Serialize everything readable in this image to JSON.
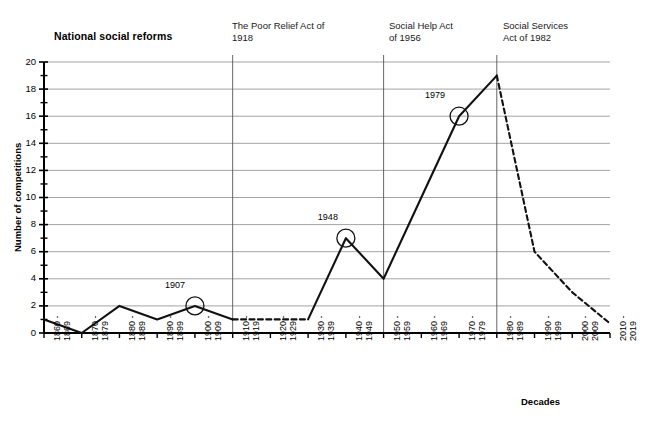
{
  "chart_data": {
    "type": "line",
    "title": "",
    "xlabel": "Decades",
    "ylabel": "Number of competitions",
    "ylim": [
      0,
      20
    ],
    "ytick_step": 2,
    "minor_ticks": true,
    "grid": true,
    "legend": "none",
    "categories": [
      "1860 -\n1869",
      "1870 -\n1879",
      "1880 -\n1889",
      "1890 -\n1899",
      "1900 -\n1909",
      "1910 -\n1919",
      "1920 -\n1929",
      "1930 -\n1939",
      "1940 -\n1949",
      "1950 -\n1959",
      "1960 -\n1969",
      "1970 -\n1979",
      "1980 -\n1989",
      "1990 -\n1999",
      "2000 -\n2009",
      "2010 -\n2019"
    ],
    "values": [
      1,
      0,
      2,
      1,
      2,
      1,
      1,
      1,
      7,
      4,
      10,
      16,
      19,
      6,
      3,
      0.7
    ],
    "yticks": [
      "0",
      "2",
      "4",
      "6",
      "8",
      "10",
      "12",
      "14",
      "16",
      "18",
      "20"
    ],
    "dashed_segments": [
      [
        5,
        7
      ],
      [
        12,
        15
      ]
    ],
    "markers": [
      {
        "label": "1907",
        "category_index": 4,
        "value": 2
      },
      {
        "label": "1948",
        "category_index": 8,
        "value": 7
      },
      {
        "label": "1979",
        "category_index": 11,
        "value": 16
      }
    ],
    "annotations": [
      {
        "label": "National social reforms",
        "bold": true,
        "divider": false
      },
      {
        "label": "The Poor Relief Act of\n1918",
        "bold": false,
        "divider": true,
        "category_index": 5
      },
      {
        "label": "Social Help Act\nof 1956",
        "bold": false,
        "divider": true,
        "category_index": 9
      },
      {
        "label": "Social Services\nAct of 1982",
        "bold": false,
        "divider": true,
        "category_index": 12
      }
    ],
    "colors": {
      "line": "#111111",
      "grid": "#8c8c8c",
      "axis": "#000000",
      "divider": "#555555",
      "marker": "#111111",
      "background": "#ffffff"
    }
  }
}
